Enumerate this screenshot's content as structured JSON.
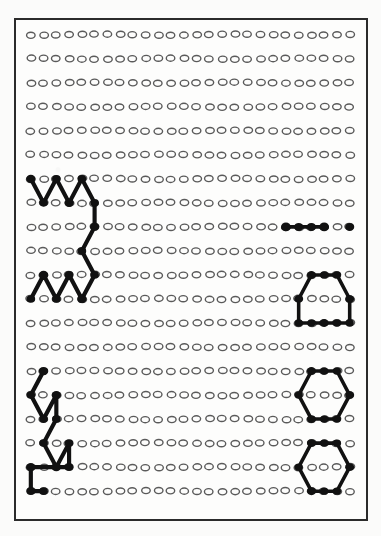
{
  "document": {
    "title": "Pegboard Pattern Sheet",
    "kind": "scanned-diagram",
    "background_color": "#fdfdfc",
    "border_color": "#2b2b2b",
    "ink_color": "#111111",
    "hole_outline_color": "#5a5a5a"
  },
  "grid": {
    "columns": 26,
    "rows": 20,
    "origin_x": 15,
    "origin_y": 14,
    "step_x": 12.9,
    "step_y": 24.3,
    "hole_rx": 4.3,
    "hole_ry": 3.1,
    "hole_stroke_width": 1.4,
    "label": "dot matrix of open circular holes"
  },
  "figures": [
    {
      "id": "zigzag-upper-left",
      "name": "double-w-zigzag-path",
      "description": "Two W shaped zigzags joined by a descending vertical segment, upper left quadrant",
      "stroke_width": 4.2,
      "node_radius": 4.4,
      "points": [
        [
          0,
          6
        ],
        [
          1,
          7
        ],
        [
          2,
          6
        ],
        [
          3,
          7
        ],
        [
          4,
          6
        ],
        [
          5,
          7
        ],
        [
          5,
          8
        ],
        [
          4,
          9
        ],
        [
          5,
          10
        ],
        [
          4,
          11
        ],
        [
          3,
          10
        ],
        [
          2,
          11
        ],
        [
          1,
          10
        ],
        [
          0,
          11
        ]
      ]
    },
    {
      "id": "filled-row-right",
      "name": "horizontal-filled-dot-run",
      "description": "Run of filled holes along row 8 at the right edge, with a detached filled hole at the far right",
      "stroke_width": 4.0,
      "node_radius": 4.6,
      "points": [
        [
          20,
          8
        ],
        [
          21,
          8
        ],
        [
          22,
          8
        ],
        [
          23,
          8
        ]
      ],
      "extra_dots": [
        [
          25,
          8
        ]
      ]
    },
    {
      "id": "trapezoid-right",
      "name": "trapezoid-outline",
      "description": "Closed trapezoid with flat top spanning rows 10 to 12 on the right",
      "stroke_width": 3.6,
      "node_radius": 4.2,
      "closed": true,
      "points": [
        [
          22,
          10
        ],
        [
          23,
          10
        ],
        [
          24,
          10
        ],
        [
          25,
          11
        ],
        [
          25,
          12
        ],
        [
          24,
          12
        ],
        [
          23,
          12
        ],
        [
          22,
          12
        ],
        [
          21,
          12
        ],
        [
          21,
          11
        ]
      ]
    },
    {
      "id": "hexagon-upper-right",
      "name": "hexagon-outline-upper",
      "description": "Closed hexagon spanning rows 14 to 16 on the right",
      "stroke_width": 3.6,
      "node_radius": 4.2,
      "closed": true,
      "points": [
        [
          22,
          14
        ],
        [
          23,
          14
        ],
        [
          24,
          14
        ],
        [
          25,
          15
        ],
        [
          24,
          16
        ],
        [
          23,
          16
        ],
        [
          22,
          16
        ],
        [
          21,
          15
        ]
      ]
    },
    {
      "id": "hexagon-lower-right",
      "name": "hexagon-outline-lower",
      "description": "Closed hexagon spanning rows 17 to 19 on the right",
      "stroke_width": 3.6,
      "node_radius": 4.2,
      "closed": true,
      "points": [
        [
          22,
          17
        ],
        [
          23,
          17
        ],
        [
          24,
          17
        ],
        [
          25,
          18
        ],
        [
          24,
          19
        ],
        [
          23,
          19
        ],
        [
          22,
          19
        ],
        [
          21,
          18
        ]
      ]
    },
    {
      "id": "zigzag-lower-left",
      "name": "stepped-zigzag-with-bracket",
      "description": "Narrow vertical zigzag descending into an L shaped bracket, lower left quadrant",
      "stroke_width": 4.2,
      "node_radius": 4.4,
      "points": [
        [
          1,
          14
        ],
        [
          0,
          15
        ],
        [
          1,
          16
        ],
        [
          2,
          15
        ],
        [
          2,
          16
        ],
        [
          1,
          17
        ],
        [
          2,
          18
        ],
        [
          3,
          17
        ],
        [
          3,
          18
        ],
        [
          0,
          18
        ],
        [
          0,
          19
        ],
        [
          1,
          19
        ]
      ]
    },
    {
      "id": "checkerboard-lower-left",
      "name": "alternating-filled-hole-pattern",
      "description": "Staggered block of filled holes forming a checkerboard in the bottom left corner",
      "node_radius": 4.8,
      "dots": [
        [
          0,
          21
        ],
        [
          2,
          21
        ],
        [
          4,
          21
        ],
        [
          1,
          22
        ],
        [
          3,
          22
        ],
        [
          5,
          22
        ],
        [
          0,
          23
        ],
        [
          2,
          23
        ],
        [
          4,
          23
        ]
      ]
    },
    {
      "id": "polygon-bottom-right",
      "name": "compound-polygon-with-inner-notch",
      "description": "Irregular closed polygon with a notched upper lobe and a filled centre hole, bottom right corner",
      "stroke_width": 3.6,
      "node_radius": 4.4,
      "closed": true,
      "points": [
        [
          21,
          21
        ],
        [
          21,
          22
        ],
        [
          22,
          23
        ],
        [
          23,
          23
        ],
        [
          24,
          23
        ],
        [
          25,
          22
        ],
        [
          25,
          21
        ],
        [
          24,
          21
        ],
        [
          23,
          21
        ],
        [
          23,
          22
        ],
        [
          22,
          21
        ]
      ],
      "extra_dots": [
        [
          22,
          22
        ]
      ]
    }
  ]
}
